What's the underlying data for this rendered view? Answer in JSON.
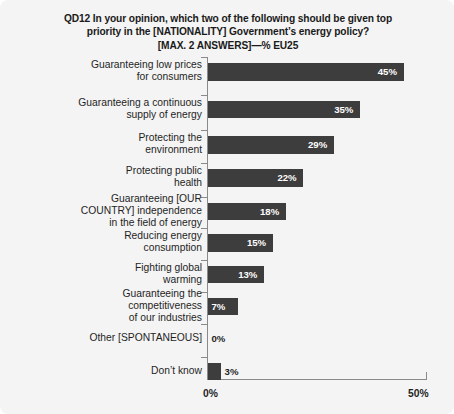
{
  "title": {
    "line1": "QD12 In your opinion, which two of the following should be given top",
    "line2": "priority in the [NATIONALITY] Government’s energy policy?",
    "line3": "[MAX. 2 ANSWERS]—% EU25"
  },
  "axis": {
    "x_tick_min": "0%",
    "x_tick_max": "50%"
  },
  "colors": {
    "bar": "#3d3d3d",
    "background": "#f4f4f4",
    "axis": "#8a8a8a",
    "text": "#1f1f1f",
    "value_label_inside": "#ffffff"
  },
  "chart_data": {
    "type": "bar",
    "orientation": "horizontal",
    "title": "QD12 In your opinion, which two of the following should be given top priority in the [NATIONALITY] Government’s energy policy? [MAX. 2 ANSWERS]—% EU25",
    "xlabel": "",
    "ylabel": "",
    "xlim": [
      0,
      50
    ],
    "grid": false,
    "legend": null,
    "xtick_labels": [
      "0%",
      "50%"
    ],
    "xticks": [
      0,
      50
    ],
    "categories": [
      "Guaranteeing low prices\nfor consumers",
      "Guaranteeing a continuous\nsupply of energy",
      "Protecting the\nenvironment",
      "Protecting public\nhealth",
      "Guaranteeing [OUR\nCOUNTRY] independence\nin the field of energy",
      "Reducing energy\nconsumption",
      "Fighting global\nwarming",
      "Guaranteeing the\ncompetitiveness\nof our industries",
      "Other [SPONTANEOUS]",
      "Don’t know"
    ],
    "values": [
      45,
      35,
      29,
      22,
      18,
      15,
      13,
      7,
      0,
      3
    ],
    "data_labels": [
      "45%",
      "35%",
      "29%",
      "22%",
      "18%",
      "15%",
      "13%",
      "7%",
      "0%",
      "3%"
    ]
  }
}
